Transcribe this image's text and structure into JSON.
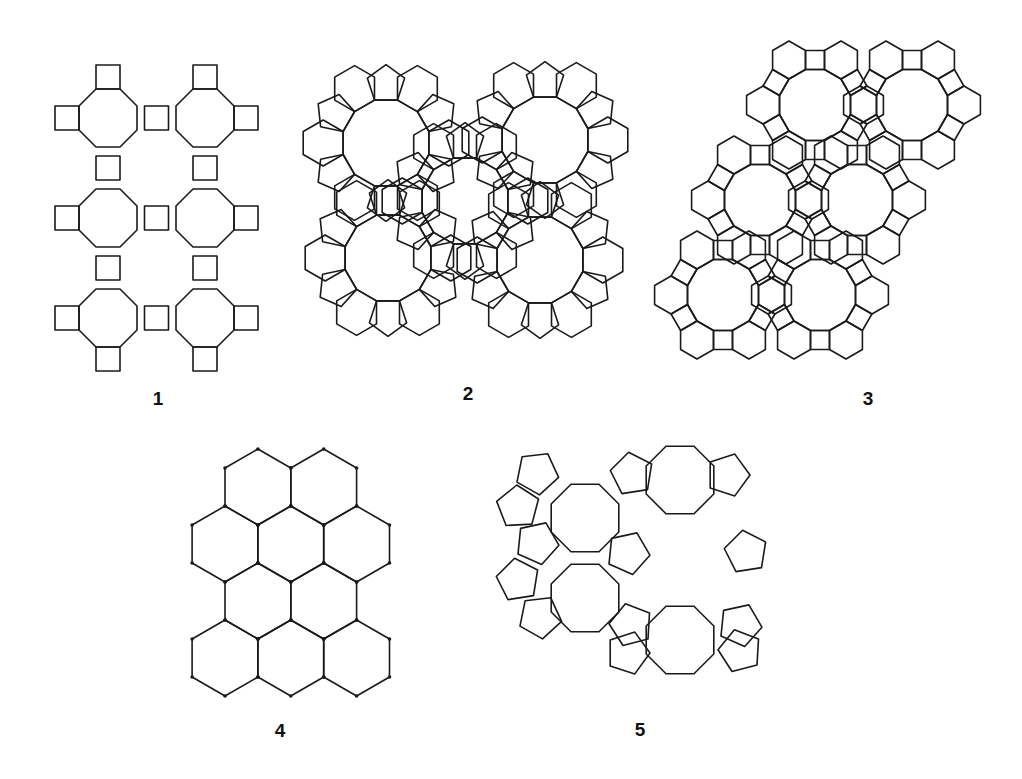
{
  "figures": [
    {
      "id": "1",
      "label": "1",
      "label_pos": [
        158,
        398
      ],
      "description": "Octagon-square net (4.8.8)",
      "polygon_types": [
        "octagon",
        "square"
      ],
      "grid": {
        "cols": 2,
        "rows": 3
      }
    },
    {
      "id": "2",
      "label": "2",
      "label_pos": [
        468,
        393
      ],
      "description": "Dodecagons surrounded by pentagons and hexagons",
      "polygon_types": [
        "dodecagon",
        "pentagon",
        "hexagon"
      ],
      "large_rings": 5
    },
    {
      "id": "3",
      "label": "3",
      "label_pos": [
        868,
        398
      ],
      "description": "Dodecagon-hexagon-square net (4.6.12)",
      "polygon_types": [
        "dodecagon",
        "hexagon",
        "square"
      ],
      "large_rings": 6
    },
    {
      "id": "4",
      "label": "4",
      "label_pos": [
        280,
        730
      ],
      "description": "Hexagonal honeycomb net (6.6.6)",
      "polygon_types": [
        "hexagon"
      ],
      "rows": [
        2,
        3,
        2,
        3
      ]
    },
    {
      "id": "5",
      "label": "5",
      "label_pos": [
        640,
        729
      ],
      "description": "Octagons surrounded by pentagons",
      "polygon_types": [
        "octagon",
        "pentagon"
      ],
      "large_rings": 5
    }
  ],
  "colors": {
    "line": "#1a1a1a",
    "background": "#ffffff"
  }
}
